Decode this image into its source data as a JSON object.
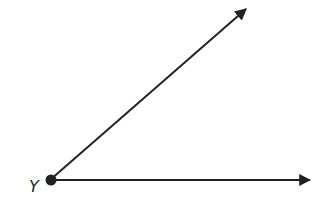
{
  "diagram": {
    "type": "angle",
    "vertex": {
      "label": "Y",
      "x": 50,
      "y": 180
    },
    "rays": [
      {
        "name": "upper-ray",
        "end": {
          "x": 248,
          "y": 7
        }
      },
      {
        "name": "horizontal-ray",
        "end": {
          "x": 312,
          "y": 181
        }
      }
    ],
    "stroke_color": "#222222"
  }
}
